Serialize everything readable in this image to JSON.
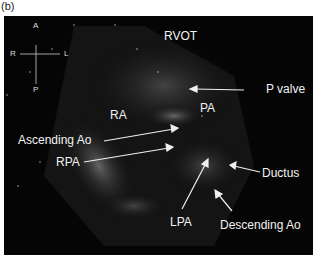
{
  "panel_label": "(b)",
  "orientation": {
    "anterior": "A",
    "posterior": "P",
    "right": "R",
    "left": "L"
  },
  "labels": {
    "rvot": "RVOT",
    "ra": "RA",
    "pa": "PA",
    "p_valve": "P valve",
    "ascending_ao": "Ascending Ao",
    "rpa": "RPA",
    "ductus": "Ductus",
    "lpa": "LPA",
    "descending_ao": "Descending Ao"
  }
}
